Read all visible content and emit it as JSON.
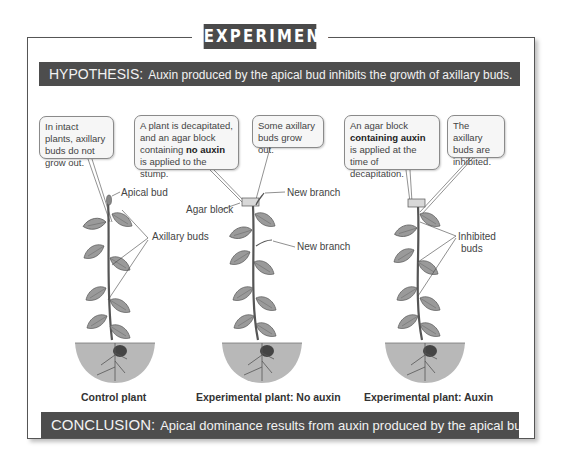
{
  "title": "EXPERIMENT",
  "hypothesis": {
    "label": "HYPOTHESIS:",
    "text": "Auxin produced by the apical bud inhibits the growth of axillary buds."
  },
  "callouts": [
    {
      "id": "control",
      "text_parts": [
        "In intact plants, axillary buds do not grow out."
      ]
    },
    {
      "id": "no-auxin-setup",
      "pre": "A plant is decapitated, and an agar block containing ",
      "bold": "no auxin",
      "post": " is applied to the stump."
    },
    {
      "id": "no-auxin-result",
      "text": "Some axillary buds grow out."
    },
    {
      "id": "auxin-setup",
      "pre": "An agar block ",
      "bold": "containing auxin",
      "post": " is applied at the time of decapitation."
    },
    {
      "id": "auxin-result",
      "text": "The axillary buds are inhibited."
    }
  ],
  "labels": {
    "apical_bud": "Apical bud",
    "axillary_buds": "Axillary buds",
    "agar_block": "Agar block",
    "new_branch_1": "New branch",
    "new_branch_2": "New branch",
    "inhibited_buds_1": "Inhibited",
    "inhibited_buds_2": "buds"
  },
  "captions": {
    "control": "Control plant",
    "no_auxin": "Experimental plant: No auxin",
    "auxin": "Experimental plant: Auxin"
  },
  "conclusion": {
    "label": "CONCLUSION:",
    "text": "Apical dominance results from auxin produced by the apical bud."
  },
  "colors": {
    "bar_bg": "#4d4d4d",
    "soil": "#b8b8b8",
    "leaf": "#9a9a9a",
    "callout_bg": "#f6f6f6"
  }
}
